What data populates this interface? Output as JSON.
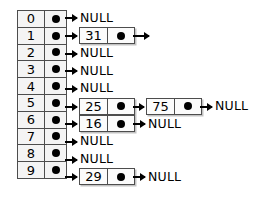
{
  "diagram": {
    "null_label": "NULL",
    "colors": {
      "background": "#ffffff",
      "border": "#4d4d4d",
      "cell_fill": "#f4f4f4",
      "node_fill": "#fbfbfb",
      "ink": "#000000"
    },
    "buckets": [
      {
        "index": "0",
        "pointer": "dot",
        "chain": [],
        "terminator": "NULL"
      },
      {
        "index": "1",
        "pointer": "dot",
        "chain": [
          "31"
        ],
        "terminator": ""
      },
      {
        "index": "2",
        "pointer": "dot",
        "chain": [],
        "terminator": "NULL"
      },
      {
        "index": "3",
        "pointer": "dot",
        "chain": [],
        "terminator": "NULL"
      },
      {
        "index": "4",
        "pointer": "dot",
        "chain": [],
        "terminator": "NULL"
      },
      {
        "index": "5",
        "pointer": "dot",
        "chain": [
          "25",
          "75"
        ],
        "terminator": "NULL"
      },
      {
        "index": "6",
        "pointer": "dot",
        "chain": [
          "16"
        ],
        "terminator": "NULL"
      },
      {
        "index": "7",
        "pointer": "dot",
        "chain": [],
        "terminator": "NULL"
      },
      {
        "index": "8",
        "pointer": "dot",
        "chain": [],
        "terminator": "NULL"
      },
      {
        "index": "9",
        "pointer": "dot",
        "chain": [
          "29"
        ],
        "terminator": "NULL"
      }
    ]
  }
}
